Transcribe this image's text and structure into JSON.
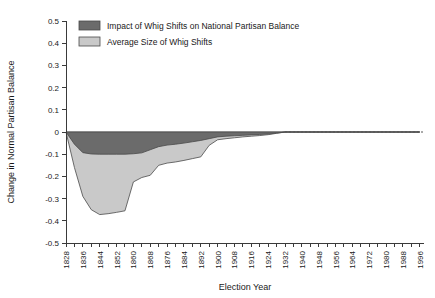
{
  "chart_data": {
    "type": "area",
    "title": "",
    "xlabel": "Election Year",
    "ylabel": "Change in Normal Partisan Balance",
    "xlim": [
      1828,
      1998
    ],
    "ylim": [
      -0.5,
      0.5
    ],
    "grid": false,
    "legend_position": "top-left",
    "y_ticks": [
      "0.5",
      "0.4",
      "0.3",
      "0.2",
      "0.1",
      "0",
      "-0.1",
      "-0.2",
      "-0.3",
      "-0.4",
      "-0.5"
    ],
    "y_tick_values": [
      0.5,
      0.4,
      0.3,
      0.2,
      0.1,
      0,
      -0.1,
      -0.2,
      -0.3,
      -0.4,
      -0.5
    ],
    "x_ticks": [
      "1828",
      "1836",
      "1844",
      "1852",
      "1860",
      "1868",
      "1876",
      "1884",
      "1892",
      "1900",
      "1908",
      "1916",
      "1924",
      "1932",
      "1940",
      "1948",
      "1956",
      "1964",
      "1972",
      "1980",
      "1988",
      "1996"
    ],
    "x_tick_values": [
      1828,
      1836,
      1844,
      1852,
      1860,
      1868,
      1876,
      1884,
      1892,
      1900,
      1908,
      1916,
      1924,
      1932,
      1940,
      1948,
      1956,
      1964,
      1972,
      1980,
      1988,
      1996
    ],
    "x_minor_tick_step": 4,
    "x": [
      1828,
      1832,
      1836,
      1840,
      1844,
      1848,
      1852,
      1856,
      1860,
      1864,
      1868,
      1872,
      1876,
      1880,
      1884,
      1888,
      1892,
      1896,
      1900,
      1904,
      1908,
      1912,
      1916,
      1920,
      1924,
      1928,
      1932,
      1936,
      1940,
      1944,
      1948,
      1952,
      1956,
      1960,
      1964,
      1968,
      1972,
      1976,
      1980,
      1984,
      1988,
      1992,
      1996
    ],
    "series": [
      {
        "name": "Impact of Whig Shifts on National Partisan Balance",
        "color": "#6b6b6b",
        "values": [
          0,
          -0.055,
          -0.093,
          -0.099,
          -0.1,
          -0.1,
          -0.1,
          -0.1,
          -0.098,
          -0.094,
          -0.08,
          -0.066,
          -0.059,
          -0.055,
          -0.05,
          -0.044,
          -0.038,
          -0.03,
          -0.022,
          -0.019,
          -0.017,
          -0.015,
          -0.013,
          -0.011,
          -0.009,
          -0.005,
          0,
          0,
          0,
          0,
          0,
          0,
          0,
          0,
          0,
          0,
          0,
          0,
          0,
          0,
          0,
          0,
          0
        ]
      },
      {
        "name": "Average Size of Whig Shifts",
        "color": "#c9c9c9",
        "values": [
          0,
          -0.16,
          -0.29,
          -0.35,
          -0.372,
          -0.368,
          -0.362,
          -0.355,
          -0.225,
          -0.205,
          -0.195,
          -0.15,
          -0.14,
          -0.135,
          -0.128,
          -0.12,
          -0.112,
          -0.06,
          -0.035,
          -0.03,
          -0.026,
          -0.022,
          -0.019,
          -0.016,
          -0.012,
          -0.006,
          0,
          0,
          0,
          0,
          0,
          0,
          0,
          0,
          0,
          0,
          0,
          0,
          0,
          0,
          0,
          0,
          0
        ]
      }
    ],
    "legend": [
      {
        "label": "Impact of Whig Shifts on National Partisan Balance",
        "color": "#6b6b6b"
      },
      {
        "label": "Average Size of Whig Shifts",
        "color": "#c9c9c9"
      }
    ]
  }
}
